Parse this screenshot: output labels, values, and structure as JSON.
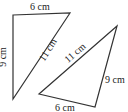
{
  "diagram": {
    "triangle_1": {
      "vertices": [
        [
          13,
          15
        ],
        [
          70,
          13
        ],
        [
          13,
          99
        ]
      ],
      "labels": {
        "top": "6 cm",
        "left": "9 cm",
        "hypotenuse": "11 cm"
      }
    },
    "triangle_2": {
      "vertices": [
        [
          117,
          26
        ],
        [
          39,
          94
        ],
        [
          95,
          107
        ]
      ],
      "labels": {
        "bottom": "6 cm",
        "right": "9 cm",
        "hypotenuse": "11 cm"
      }
    },
    "stroke_color": "#333333"
  }
}
